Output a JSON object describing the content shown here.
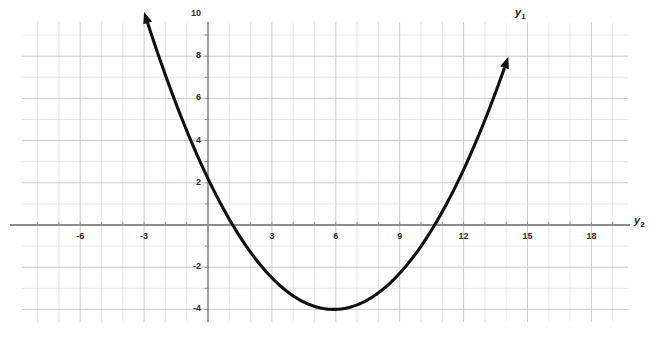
{
  "chart_data": {
    "type": "line",
    "title": "",
    "xlabel": "y_2",
    "ylabel": "y_1",
    "curve_label": "y_1",
    "axis_label_x": "y",
    "axis_label_x_sub": "2",
    "axis_label_curve": "y",
    "axis_label_curve_sub": "1",
    "xlim": [
      -8.7,
      19.7
    ],
    "ylim": [
      -6.5,
      10.5
    ],
    "grid": true,
    "grid_step": 1,
    "legend": "none",
    "xticks": [
      -6,
      -3,
      3,
      6,
      9,
      12,
      15,
      18
    ],
    "xtick_labels": [
      "-6",
      "-3",
      "3",
      "6",
      "9",
      "12",
      "15",
      "18"
    ],
    "yticks": [
      10,
      8,
      6,
      4,
      2,
      -2,
      -4,
      -6
    ],
    "ytick_labels": [
      "10",
      "8",
      "6",
      "4",
      "2",
      "-2",
      "-4",
      "-6"
    ],
    "minor_tick_step": 1,
    "function": "quadratic",
    "vertex": [
      5.9,
      -4
    ],
    "roots": [
      1.7,
      10.3
    ],
    "y_intercept": 2.2,
    "leading_coefficient": 0.178,
    "domain_drawn": [
      -3.0,
      14.1
    ],
    "arrowheads": [
      "start",
      "end"
    ],
    "x": [
      -3.0,
      -2.0,
      -1.0,
      0.0,
      1.0,
      1.7,
      2.0,
      3.0,
      4.0,
      5.0,
      5.9,
      6.0,
      7.0,
      8.0,
      9.0,
      10.0,
      10.3,
      11.0,
      12.0,
      13.0,
      14.1
    ],
    "y": [
      10.1,
      8.3,
      6.6,
      5.1,
      3.7,
      2.9,
      2.6,
      1.6,
      0.7,
      0.1,
      -0.2,
      -0.2,
      0.0,
      0.5,
      1.3,
      2.3,
      2.7,
      3.6,
      5.2,
      7.0,
      9.3
    ]
  },
  "colors": {
    "grid": "#d9dde3",
    "grid_major": "#c6ccd4",
    "axis": "#8c8c8c",
    "curve": "#111111",
    "tick_text": "#2b2b2b",
    "background": "#ffffff"
  },
  "ticks": {
    "x": [
      {
        "label": "-6",
        "value": -6
      },
      {
        "label": "-3",
        "value": -3
      },
      {
        "label": "3",
        "value": 3
      },
      {
        "label": "6",
        "value": 6
      },
      {
        "label": "9",
        "value": 9
      },
      {
        "label": "12",
        "value": 12
      },
      {
        "label": "15",
        "value": 15
      },
      {
        "label": "18",
        "value": 18
      }
    ],
    "y": [
      {
        "label": "10",
        "value": 10
      },
      {
        "label": "8",
        "value": 8
      },
      {
        "label": "6",
        "value": 6
      },
      {
        "label": "4",
        "value": 4
      },
      {
        "label": "2",
        "value": 2
      },
      {
        "label": "-2",
        "value": -2
      },
      {
        "label": "-4",
        "value": -4
      },
      {
        "label": "-6",
        "value": -6
      }
    ]
  },
  "labels": {
    "curve": "y",
    "curve_sub": "1",
    "xaxis": "y",
    "xaxis_sub": "2"
  }
}
